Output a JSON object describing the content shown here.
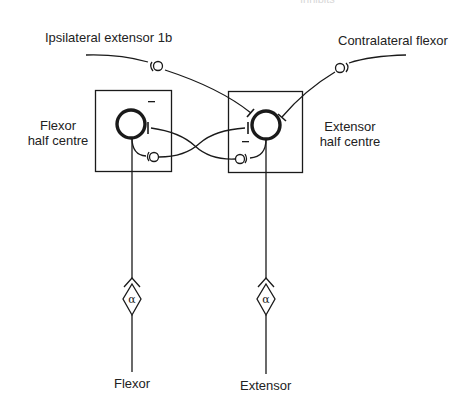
{
  "diagram": {
    "top_cutoff_text": "Inhibits",
    "inputs": {
      "ipsilateral": "Ipsilateral extensor 1b",
      "contralateral": "Contralateral flexor"
    },
    "half_centres": {
      "flexor": [
        "Flexor",
        "half centre"
      ],
      "extensor": [
        "Extensor",
        "half centre"
      ]
    },
    "motor_neuron_symbol": "α",
    "inhibitory_sign": "−",
    "outputs": {
      "flexor": "Flexor",
      "extensor": "Extensor"
    },
    "colors": {
      "line": "#1a1a1a",
      "background": "#ffffff"
    }
  }
}
